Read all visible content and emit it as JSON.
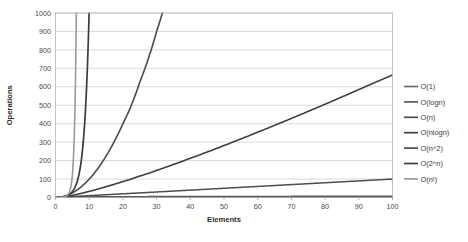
{
  "chart_data": {
    "type": "line",
    "title": "",
    "xlabel": "Elements",
    "ylabel": "Operations",
    "xlim": [
      0,
      100
    ],
    "ylim": [
      0,
      1000
    ],
    "grid": true,
    "grid_axis": "y",
    "legend_position": "right",
    "xticks": [
      0,
      10,
      20,
      30,
      40,
      50,
      60,
      70,
      80,
      90,
      100
    ],
    "yticks": [
      0,
      100,
      200,
      300,
      400,
      500,
      600,
      700,
      800,
      900,
      1000
    ],
    "x": [
      0,
      1,
      2,
      3,
      4,
      5,
      6,
      7,
      8,
      9,
      10,
      12,
      14,
      16,
      18,
      20,
      25,
      30,
      35,
      40,
      45,
      50,
      55,
      60,
      65,
      70,
      75,
      80,
      85,
      90,
      95,
      100
    ],
    "series": [
      {
        "name": "O(1)",
        "color": "#6b6b6b",
        "width": 1.5,
        "values": [
          1,
          1,
          1,
          1,
          1,
          1,
          1,
          1,
          1,
          1,
          1,
          1,
          1,
          1,
          1,
          1,
          1,
          1,
          1,
          1,
          1,
          1,
          1,
          1,
          1,
          1,
          1,
          1,
          1,
          1,
          1,
          1
        ]
      },
      {
        "name": "O(logn)",
        "color": "#5a5a5a",
        "width": 1.5,
        "values": [
          0,
          0,
          1,
          1.6,
          2,
          2.3,
          2.6,
          2.8,
          3,
          3.2,
          3.3,
          3.6,
          3.8,
          4,
          4.2,
          4.3,
          4.6,
          4.9,
          5.1,
          5.3,
          5.5,
          5.6,
          5.8,
          5.9,
          6,
          6.1,
          6.2,
          6.3,
          6.4,
          6.5,
          6.6,
          6.6
        ]
      },
      {
        "name": "O(n)",
        "color": "#4e4e4e",
        "width": 1.5,
        "values": [
          0,
          1,
          2,
          3,
          4,
          5,
          6,
          7,
          8,
          9,
          10,
          12,
          14,
          16,
          18,
          20,
          25,
          30,
          35,
          40,
          45,
          50,
          55,
          60,
          65,
          70,
          75,
          80,
          85,
          90,
          95,
          100
        ]
      },
      {
        "name": "O(nlogn)",
        "color": "#3f3f3f",
        "width": 1.6,
        "values": [
          0,
          0,
          2,
          4.8,
          8,
          11.6,
          15.5,
          19.7,
          24,
          28.5,
          33.2,
          43,
          53.3,
          64,
          75,
          86.4,
          116,
          147.2,
          179.6,
          212.9,
          246.9,
          282,
          317.3,
          354.4,
          391.2,
          428.9,
          467.2,
          505.8,
          545.2,
          585,
          625.3,
          664.4
        ]
      },
      {
        "name": "O(n^2)",
        "color": "#4a4a4a",
        "width": 1.6,
        "values": [
          0,
          1,
          4,
          9,
          16,
          25,
          36,
          49,
          64,
          81,
          100,
          144,
          196,
          256,
          324,
          400,
          625,
          900,
          1225,
          1600,
          2025,
          2500,
          3025,
          3600,
          4225,
          4900,
          5625,
          6400,
          7225,
          8100,
          9025,
          10000
        ]
      },
      {
        "name": "O(2^n)",
        "color": "#3c3c3c",
        "width": 1.7,
        "values": [
          1,
          2,
          4,
          8,
          16,
          32,
          64,
          128,
          256,
          512,
          1024,
          4096,
          16384,
          65536,
          262144,
          1048576,
          33554432,
          1073741824,
          34359738368,
          1099511627776,
          35184372088832,
          1125899906842624,
          36028797018963968,
          1152921504606847000,
          36893488147419100000,
          1180591620717410000000,
          37778931862957200000000,
          1208925819614630000000000,
          38685626227668100000000000,
          1237940039285380000000000000,
          39614081257132200000000000000,
          1267650600228230000000000000000
        ]
      },
      {
        "name": "O(n!)",
        "color": "#9a9a9a",
        "width": 1.6,
        "values": [
          1,
          1,
          2,
          6,
          24,
          120,
          720,
          5040,
          40320,
          362880,
          3628800,
          479001600,
          87178291200,
          20922789888000,
          6402373705728000,
          2432902008176640000,
          15511210043330985000000000,
          265252859812191000000000000000000,
          10333147966386145000000000000000000000000,
          815915283247898000000000000000000000000000000000,
          1.1962222086548019e+56,
          3.0414093201713376e+64,
          1.2696403353658276e+73,
          8.320987112741392e+81,
          8.247650592082472e+90,
          1.197857166996989e+100,
          2.48035542436831e+109,
          7.156945704626381e+118,
          2.81710411438055e+129,
          1.4857159644817607e+140,
          1.0329978488239059e+152,
          9.332621544394415e+157
        ]
      }
    ]
  },
  "axes": {
    "x_title": "Elements",
    "y_title": "Operations",
    "x_tick_labels": [
      "0",
      "10",
      "20",
      "30",
      "40",
      "50",
      "60",
      "70",
      "80",
      "90",
      "100"
    ],
    "y_tick_labels": [
      "0",
      "100",
      "200",
      "300",
      "400",
      "500",
      "600",
      "700",
      "800",
      "900",
      "1000"
    ]
  },
  "legend": {
    "items": [
      {
        "label": "O(1)",
        "color": "#6b6b6b"
      },
      {
        "label": "O(logn)",
        "color": "#5a5a5a"
      },
      {
        "label": "O(n)",
        "color": "#4e4e4e"
      },
      {
        "label": "O(nlogn)",
        "color": "#3f3f3f"
      },
      {
        "label": "O(n^2)",
        "color": "#4a4a4a"
      },
      {
        "label": "O(2^n)",
        "color": "#3c3c3c"
      },
      {
        "label": "O(n!)",
        "color": "#9a9a9a"
      }
    ]
  }
}
